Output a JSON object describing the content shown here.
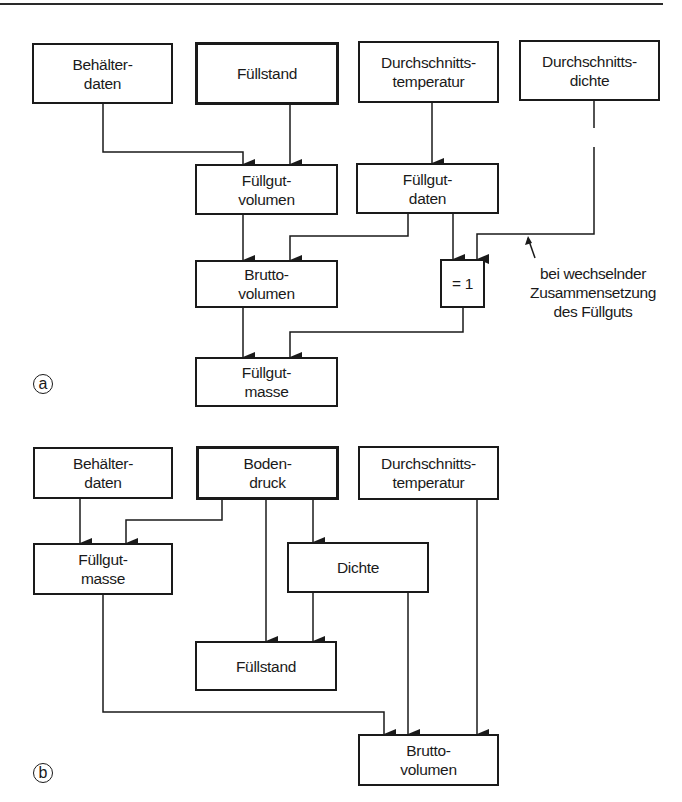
{
  "figure": {
    "panels": [
      {
        "label": "a",
        "nodes": {
          "behaelterdaten": {
            "line1": "Behälter-",
            "line2": "daten"
          },
          "fuellstand": {
            "line1": "Füllstand",
            "line2": ""
          },
          "temperatur": {
            "line1": "Durchschnitts-",
            "line2": "temperatur"
          },
          "dichte": {
            "line1": "Durchschnitts-",
            "line2": "dichte"
          },
          "fuellgutvolumen": {
            "line1": "Füllgut-",
            "line2": "volumen"
          },
          "fuellgutdaten": {
            "line1": "Füllgut-",
            "line2": "daten"
          },
          "bruttovolumen": {
            "line1": "Brutto-",
            "line2": "volumen"
          },
          "eins": {
            "line1": "= 1",
            "line2": ""
          },
          "fuellgutmasse": {
            "line1": "Füllgut-",
            "line2": "masse"
          }
        },
        "note": {
          "line1": "bei wechselnder",
          "line2": "Zusammensetzung",
          "line3": "des Füllguts"
        },
        "edges": [
          [
            "Behälterdaten",
            "Füllgutvolumen"
          ],
          [
            "Füllstand",
            "Füllgutvolumen"
          ],
          [
            "Durchschnittstemperatur",
            "Füllgutdaten"
          ],
          [
            "Füllgutvolumen",
            "Bruttovolumen"
          ],
          [
            "Füllgutdaten",
            "Bruttovolumen"
          ],
          [
            "Füllgutdaten",
            "= 1"
          ],
          [
            "Durchschnittsdichte",
            "= 1"
          ],
          [
            "Bruttovolumen",
            "Füllgutmasse"
          ],
          [
            "= 1",
            "Füllgutmasse"
          ]
        ]
      },
      {
        "label": "b",
        "nodes": {
          "behaelterdaten": {
            "line1": "Behälter-",
            "line2": "daten"
          },
          "bodendruck": {
            "line1": "Boden-",
            "line2": "druck"
          },
          "temperatur": {
            "line1": "Durchschnitts-",
            "line2": "temperatur"
          },
          "fuellgutmasse": {
            "line1": "Füllgut-",
            "line2": "masse"
          },
          "dichte": {
            "line1": "Dichte",
            "line2": ""
          },
          "fuellstand": {
            "line1": "Füllstand",
            "line2": ""
          },
          "bruttovolumen": {
            "line1": "Brutto-",
            "line2": "volumen"
          }
        },
        "edges": [
          [
            "Behälterdaten",
            "Füllgutmasse"
          ],
          [
            "Bodendruck",
            "Füllgutmasse"
          ],
          [
            "Bodendruck",
            "Füllstand"
          ],
          [
            "Bodendruck",
            "Dichte"
          ],
          [
            "Dichte",
            "Füllstand"
          ],
          [
            "Füllgutmasse",
            "Bruttovolumen"
          ],
          [
            "Dichte",
            "Bruttovolumen"
          ],
          [
            "Durchschnittstemperatur",
            "Bruttovolumen"
          ]
        ]
      }
    ],
    "colors": {
      "line": "#1a1a1a",
      "background": "#ffffff"
    }
  }
}
